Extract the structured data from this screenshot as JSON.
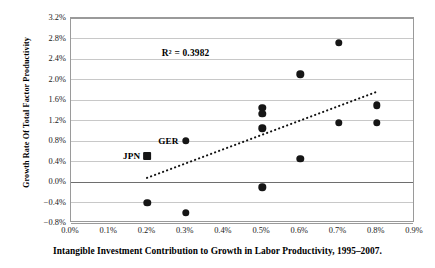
{
  "chart_data": {
    "type": "scatter",
    "title": "",
    "xlabel": "Intangible Investment Contribution to Growth in Labor Productivity, 1995–2007.",
    "ylabel": "Growth Rate Of Total Factor Productivity",
    "xlim": [
      0.0,
      0.9
    ],
    "ylim": [
      -0.8,
      3.2
    ],
    "xtick_step": 0.1,
    "ytick_step": 0.4,
    "xticks": [
      "0.0%",
      "0.1%",
      "0.2%",
      "0.3%",
      "0.4%",
      "0.5%",
      "0.6%",
      "0.7%",
      "0.8%",
      "0.9%"
    ],
    "yticks": [
      "3.2%",
      "2.8%",
      "2.4%",
      "2.0%",
      "1.6%",
      "1.2%",
      "0.8%",
      "0.4%",
      "0.0%",
      "−0.4%",
      "−0.8%"
    ],
    "grid": "horizontal",
    "legend": "none",
    "annotations": [
      {
        "text": "R² = 0.3982",
        "x": 0.3,
        "y": 2.52
      }
    ],
    "points": [
      {
        "x": 0.2,
        "y": 0.5,
        "label": "JPN",
        "marker": "square"
      },
      {
        "x": 0.3,
        "y": 0.8,
        "label": "GER",
        "marker": "circle"
      },
      {
        "x": 0.2,
        "y": -0.4,
        "label": "",
        "marker": "circle"
      },
      {
        "x": 0.3,
        "y": -0.6,
        "label": "",
        "marker": "circle"
      },
      {
        "x": 0.5,
        "y": 1.45,
        "label": "",
        "marker": "circle"
      },
      {
        "x": 0.5,
        "y": 1.33,
        "label": "",
        "marker": "circle"
      },
      {
        "x": 0.5,
        "y": 1.05,
        "label": "",
        "marker": "circle"
      },
      {
        "x": 0.5,
        "y": -0.1,
        "label": "",
        "marker": "circle"
      },
      {
        "x": 0.6,
        "y": 2.1,
        "label": "",
        "marker": "circle"
      },
      {
        "x": 0.6,
        "y": 0.45,
        "label": "",
        "marker": "circle"
      },
      {
        "x": 0.7,
        "y": 2.72,
        "label": "",
        "marker": "circle"
      },
      {
        "x": 0.7,
        "y": 1.15,
        "label": "",
        "marker": "circle"
      },
      {
        "x": 0.8,
        "y": 1.5,
        "label": "",
        "marker": "circle"
      },
      {
        "x": 0.8,
        "y": 1.15,
        "label": "",
        "marker": "circle"
      }
    ],
    "trendline": {
      "style": "dotted",
      "x0": 0.2,
      "y0": 0.05,
      "x1": 0.81,
      "y1": 1.76
    },
    "colors": {
      "marker": "#161616",
      "grid": "#c8c8c8",
      "axis": "#9a9a9a",
      "zero_line": "#6e6e6e",
      "text": "#000000"
    }
  }
}
